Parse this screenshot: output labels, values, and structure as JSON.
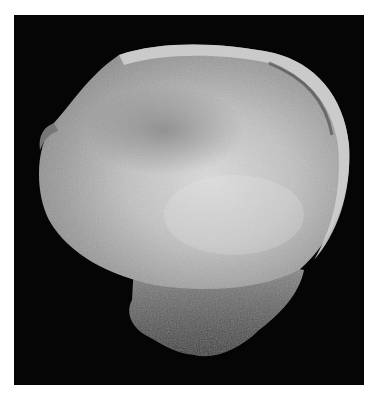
{
  "image": {
    "subject": "fossil-specimen",
    "background_color": "#050505",
    "border_color": "#ffffff",
    "specimen_colors": {
      "disc_light": "#d8d8d8",
      "disc_mid": "#a9a9a9",
      "disc_dark": "#7a7a7a",
      "rim": "#c8c8c8",
      "base": "#6e6e6e"
    }
  }
}
